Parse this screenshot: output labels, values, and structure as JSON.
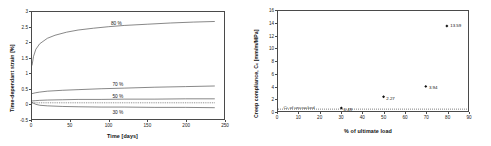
{
  "chart_data": [
    {
      "id": "creep-strain-vs-time",
      "type": "line",
      "title": "",
      "xlabel": "Time [days]",
      "ylabel": "Time-dependant strain [%]",
      "xlim": [
        0,
        250
      ],
      "ylim": [
        -0.5,
        3
      ],
      "xticks": [
        0,
        50,
        100,
        150,
        200,
        250
      ],
      "yticks": [
        -0.5,
        0,
        0.5,
        1,
        1.5,
        2,
        2.5,
        3
      ],
      "xtick_labels": [
        "0",
        "50",
        "100",
        "150",
        "200",
        "250"
      ],
      "ytick_labels": [
        "-0.5",
        "0",
        "0.5",
        "1",
        "1.5",
        "2",
        "2.5",
        "3"
      ],
      "grid": false,
      "legend": "inline-annotations",
      "series": [
        {
          "name": "80 %",
          "label": "80 %",
          "label_x": 110,
          "label_y": 2.62,
          "style": "solid",
          "x": [
            0,
            2,
            5,
            10,
            20,
            30,
            45,
            60,
            80,
            100,
            120,
            150,
            180,
            210,
            238
          ],
          "y": [
            1.25,
            1.55,
            1.78,
            1.96,
            2.14,
            2.24,
            2.34,
            2.41,
            2.47,
            2.52,
            2.56,
            2.6,
            2.64,
            2.67,
            2.69
          ]
        },
        {
          "name": "70 %",
          "label": "70 %",
          "label_x": 112,
          "label_y": 0.66,
          "style": "solid",
          "x": [
            0,
            5,
            10,
            20,
            40,
            60,
            90,
            120,
            160,
            200,
            238
          ],
          "y": [
            0.33,
            0.36,
            0.38,
            0.41,
            0.44,
            0.46,
            0.49,
            0.51,
            0.54,
            0.56,
            0.58
          ]
        },
        {
          "name": "50 %",
          "label": "50 %",
          "label_x": 112,
          "label_y": 0.28,
          "style": "solid",
          "x": [
            0,
            5,
            10,
            20,
            40,
            60,
            90,
            120,
            160,
            200,
            238
          ],
          "y": [
            0.09,
            0.1,
            0.11,
            0.12,
            0.13,
            0.14,
            0.14,
            0.15,
            0.15,
            0.16,
            0.16
          ]
        },
        {
          "name": "30 %",
          "label": "30 %",
          "label_x": 112,
          "label_y": -0.23,
          "style": "solid",
          "x": [
            0,
            5,
            10,
            20,
            40,
            60,
            90,
            120,
            160,
            200,
            238
          ],
          "y": [
            0.04,
            -0.02,
            -0.05,
            -0.07,
            -0.09,
            -0.1,
            -0.11,
            -0.11,
            -0.12,
            -0.12,
            -0.13
          ]
        },
        {
          "name": "baseline-dotted",
          "label": "",
          "style": "dotted",
          "x": [
            0,
            238
          ],
          "y": [
            0.03,
            0.03
          ]
        }
      ]
    },
    {
      "id": "creep-compliance-vs-load",
      "type": "scatter",
      "title": "",
      "xlabel": "% of ultimate load",
      "ylabel": "Creep compliance, Cc  [mm/m/MPa]",
      "ylabel_main": "Creep compliance, C",
      "ylabel_sub": "c",
      "ylabel_unit": "  [mm/m/MPa]",
      "xlim": [
        0,
        90
      ],
      "ylim": [
        0,
        16
      ],
      "xticks": [
        0,
        10,
        20,
        30,
        40,
        50,
        60,
        70,
        80,
        90
      ],
      "yticks": [
        0,
        2,
        4,
        6,
        8,
        10,
        12,
        14,
        16
      ],
      "xtick_labels": [
        "0",
        "10",
        "20",
        "30",
        "40",
        "50",
        "60",
        "70",
        "80",
        "90"
      ],
      "ytick_labels": [
        "0",
        "2",
        "4",
        "6",
        "8",
        "10",
        "12",
        "14",
        "16"
      ],
      "grid": false,
      "marker": "filled-diamond",
      "points": [
        {
          "x": 30,
          "y": 0.49,
          "label": "0.49"
        },
        {
          "x": 50,
          "y": 2.27,
          "label": "2.27"
        },
        {
          "x": 70,
          "y": 3.94,
          "label": "3.94"
        },
        {
          "x": 80,
          "y": 13.59,
          "label": "13.59"
        }
      ],
      "reference_line": {
        "style": "dotted",
        "y": 0.3,
        "annotation": "Cc of uncracked",
        "annotation_main": "C",
        "annotation_sub": "c",
        "annotation_rest": " of uncracked",
        "annotation_x": 3,
        "annotation_y": 1.15
      }
    }
  ],
  "colors": {
    "axis": "#4a4a4a",
    "curve": "#555555",
    "marker": "#111111",
    "text": "#1a1a1a",
    "background": "#ffffff"
  }
}
